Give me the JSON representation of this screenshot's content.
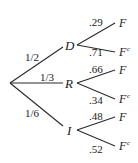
{
  "tree": {
    "root_branches": [
      {
        "node": "D",
        "prob": "1/2",
        "children": [
          {
            "leaf": "F",
            "sup": "",
            "prob": ".29"
          },
          {
            "leaf": "F",
            "sup": "c",
            "prob": ".71"
          }
        ]
      },
      {
        "node": "R",
        "prob": "1/3",
        "children": [
          {
            "leaf": "F",
            "sup": "",
            "prob": ".66"
          },
          {
            "leaf": "F",
            "sup": "c",
            "prob": ".34"
          }
        ]
      },
      {
        "node": "I",
        "prob": "1/6",
        "children": [
          {
            "leaf": "F",
            "sup": "",
            "prob": ".48"
          },
          {
            "leaf": "F",
            "sup": "c",
            "prob": ".52"
          }
        ]
      }
    ]
  },
  "colors": {
    "ink": "#1a1a1a",
    "background": "#ffffff"
  }
}
